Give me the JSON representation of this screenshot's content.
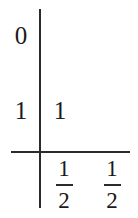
{
  "figure": {
    "type": "math-table",
    "background_color": "#ffffff",
    "ink_color": "#2b2b2b",
    "rules": {
      "vertical_rule": "|",
      "horizontal_rule": "—"
    },
    "row_labels": [
      {
        "text": "0"
      },
      {
        "text": "1"
      }
    ],
    "body_cells": [
      {
        "text": "1"
      }
    ],
    "bottom_entries": [
      {
        "numerator": "1",
        "denominator": "2",
        "text": "1/2"
      },
      {
        "numerator": "1",
        "denominator": "2",
        "text": "1/2"
      }
    ]
  }
}
